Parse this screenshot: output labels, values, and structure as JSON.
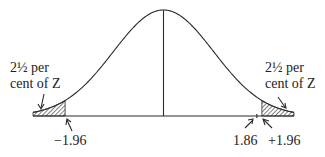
{
  "diagram": {
    "type": "normal-distribution",
    "mean": 0,
    "x_range": [
      -2.6,
      2.6
    ],
    "shaded_tails": [
      {
        "side": "left",
        "from": -2.6,
        "to": -1.96
      },
      {
        "side": "right",
        "from": 1.96,
        "to": 2.6
      }
    ],
    "labels": {
      "left_tail_line1": "2½ per",
      "left_tail_line2": "cent of Z",
      "right_tail_line1": "2½ per",
      "right_tail_line2": "cent of Z",
      "left_critical": "−1.96",
      "right_value": "1.86",
      "right_critical": "+1.96"
    },
    "marked_values": [
      -1.96,
      1.86,
      1.96
    ],
    "colors": {
      "ink": "#2a2a2a",
      "background": "#ffffff"
    }
  }
}
